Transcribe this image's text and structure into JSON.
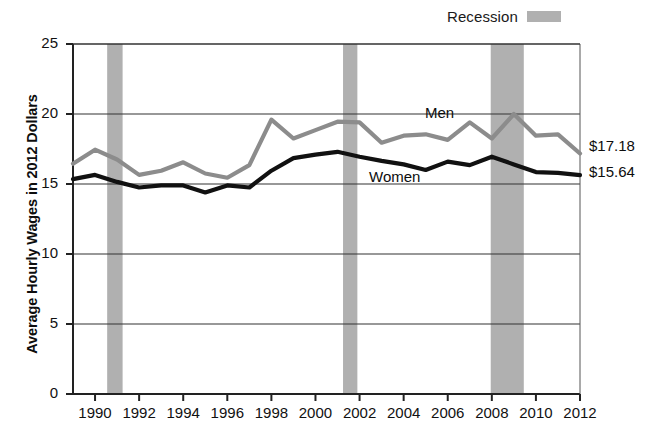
{
  "legend": {
    "recession_label": "Recession",
    "recession_color": "#b0b0b0"
  },
  "axes": {
    "ylabel": "Average Hourly Wages in 2012 Dollars",
    "yticks": [
      "0",
      "5",
      "10",
      "15",
      "20",
      "25"
    ],
    "xticks": [
      "1990",
      "1992",
      "1994",
      "1996",
      "1998",
      "2000",
      "2002",
      "2004",
      "2006",
      "2008",
      "2010",
      "2012"
    ]
  },
  "annotations": {
    "men_label": "Men",
    "women_label": "Women",
    "men_end_value": "$17.18",
    "women_end_value": "$15.64"
  },
  "chart_data": {
    "type": "line",
    "title": "",
    "xlabel": "",
    "ylabel": "Average Hourly Wages in 2012 Dollars",
    "xlim": [
      1989,
      2012
    ],
    "ylim": [
      0,
      25
    ],
    "yticks": [
      0,
      5,
      10,
      15,
      20,
      25
    ],
    "xticks": [
      1990,
      1992,
      1994,
      1996,
      1998,
      2000,
      2002,
      2004,
      2006,
      2008,
      2010,
      2012
    ],
    "grid": true,
    "legend_position": "top-right",
    "x": [
      1989,
      1990,
      1991,
      1992,
      1993,
      1994,
      1995,
      1996,
      1997,
      1998,
      1999,
      2000,
      2001,
      2002,
      2003,
      2004,
      2005,
      2006,
      2007,
      2008,
      2009,
      2010,
      2011,
      2012
    ],
    "series": [
      {
        "name": "Men",
        "color": "#8c8c8c",
        "end_label": "$17.18",
        "values": [
          16.45,
          17.45,
          16.75,
          15.65,
          15.95,
          16.55,
          15.75,
          15.45,
          16.35,
          19.6,
          18.25,
          18.85,
          19.45,
          19.4,
          17.95,
          18.45,
          18.55,
          18.15,
          19.4,
          18.25,
          20.0,
          18.45,
          18.55,
          17.18
        ]
      },
      {
        "name": "Women",
        "color": "#111111",
        "end_label": "$15.64",
        "values": [
          15.35,
          15.65,
          15.15,
          14.75,
          14.9,
          14.9,
          14.4,
          14.9,
          14.75,
          15.95,
          16.85,
          17.1,
          17.3,
          16.95,
          16.65,
          16.4,
          16.0,
          16.6,
          16.35,
          16.95,
          16.4,
          15.85,
          15.8,
          15.64
        ]
      }
    ],
    "shaded_regions": [
      {
        "label": "Recession",
        "start": 1990.55,
        "end": 1991.25,
        "color": "#b0b0b0"
      },
      {
        "label": "Recession",
        "start": 2001.25,
        "end": 2001.9,
        "color": "#b0b0b0"
      },
      {
        "label": "Recession",
        "start": 2007.95,
        "end": 2009.45,
        "color": "#b0b0b0"
      }
    ]
  }
}
